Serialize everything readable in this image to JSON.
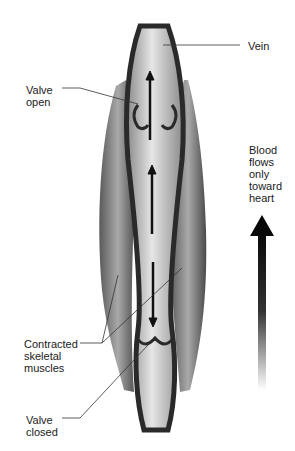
{
  "diagram": {
    "labels": {
      "vein": "Vein",
      "valve_open": "Valve\nopen",
      "contracted_muscles": "Contracted\nskeletal\nmuscles",
      "valve_closed": "Valve\nclosed",
      "blood_flow": "Blood\nflows\nonly\ntoward\nheart"
    },
    "colors": {
      "vein_wall": "#2a2a2a",
      "vein_lumen": "#c8c8c8",
      "muscle": "#7a7a7a",
      "arrow": "#111111",
      "leader_line": "#333333"
    }
  }
}
